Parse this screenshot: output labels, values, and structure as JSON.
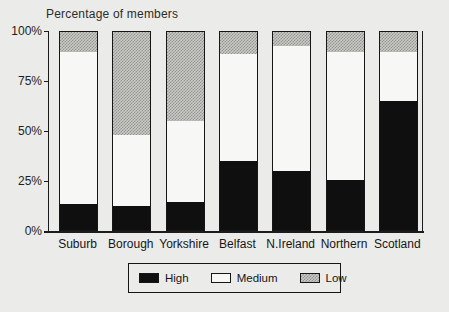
{
  "chart_data": {
    "type": "bar",
    "stacked": true,
    "title": "Percentage of members",
    "categories": [
      "Suburb",
      "Borough",
      "Yorkshire",
      "Belfast",
      "N.Ireland",
      "Northern",
      "Scotland"
    ],
    "series": [
      {
        "key": "high",
        "name": "High",
        "values": [
          13,
          12,
          14,
          35,
          30,
          25,
          65
        ]
      },
      {
        "key": "medium",
        "name": "Medium",
        "values": [
          77,
          36,
          41,
          54,
          63,
          65,
          25
        ]
      },
      {
        "key": "low",
        "name": "Low",
        "values": [
          10,
          52,
          45,
          11,
          7,
          10,
          10
        ]
      }
    ],
    "y_ticks": [
      {
        "label": "0%",
        "value": 0
      },
      {
        "label": "25%",
        "value": 25
      },
      {
        "label": "50%",
        "value": 50
      },
      {
        "label": "75%",
        "value": 75
      },
      {
        "label": "100%",
        "value": 100
      }
    ],
    "ylim": [
      0,
      100
    ],
    "xlabel": "",
    "ylabel": "",
    "grid": false,
    "legend_position": "bottom"
  },
  "colors": {
    "background": "#ebebe9",
    "axis": "#1c1c1c",
    "bar_high": "#0f0f0f",
    "bar_medium": "#f7f7f5",
    "bar_low_bg": "#c9c9c7",
    "bar_low_dot": "#95958f"
  }
}
